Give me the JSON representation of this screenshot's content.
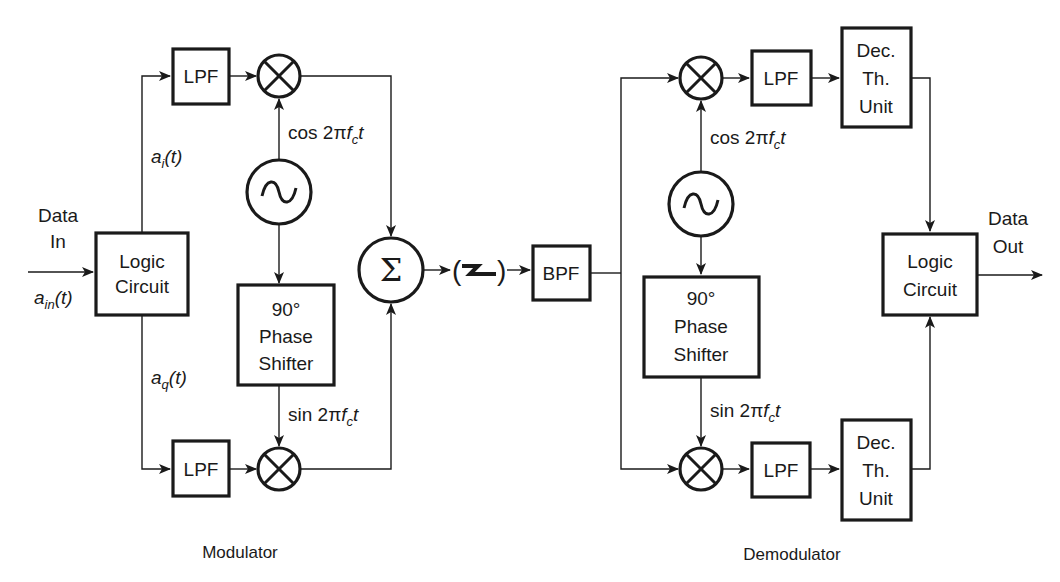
{
  "diagram": {
    "modulator": {
      "section_label": "Modulator",
      "input": {
        "line1": "Data",
        "line2": "In",
        "signal_base": "a",
        "signal_sub": "in",
        "signal_rest": "(t)"
      },
      "logic_circuit": {
        "line1": "Logic",
        "line2": "Circuit"
      },
      "i_branch_signal": {
        "base": "a",
        "sub": "i",
        "rest": "(t)"
      },
      "q_branch_signal": {
        "base": "a",
        "sub": "q",
        "rest": "(t)"
      },
      "lpf_top": "LPF",
      "lpf_bottom": "LPF",
      "mixer_symbol": "⊗",
      "oscillator_symbol": "~",
      "cos_label": {
        "prefix": "cos 2π",
        "f": "f",
        "sub": "c",
        "t": "t"
      },
      "sin_label": {
        "prefix": "sin 2π",
        "f": "f",
        "sub": "c",
        "t": "t"
      },
      "phase_shifter": {
        "line1": "90°",
        "line2": "Phase",
        "line3": "Shifter"
      },
      "summer_symbol": "Σ"
    },
    "channel": {
      "symbol_left": "(",
      "symbol_right": ")",
      "meaning": "wireless channel"
    },
    "bpf": "BPF",
    "demodulator": {
      "section_label": "Demodulator",
      "lpf_top": "LPF",
      "lpf_bottom": "LPF",
      "cos_label": {
        "prefix": "cos 2π",
        "f": "f",
        "sub": "c",
        "t": "t"
      },
      "sin_label": {
        "prefix": "sin 2π",
        "f": "f",
        "sub": "c",
        "t": "t"
      },
      "phase_shifter": {
        "line1": "90°",
        "line2": "Phase",
        "line3": "Shifter"
      },
      "dec_unit_top": {
        "line1": "Dec.",
        "line2": "Th.",
        "line3": "Unit"
      },
      "dec_unit_bottom": {
        "line1": "Dec.",
        "line2": "Th.",
        "line3": "Unit"
      },
      "logic_circuit": {
        "line1": "Logic",
        "line2": "Circuit"
      },
      "output": {
        "line1": "Data",
        "line2": "Out"
      }
    }
  }
}
